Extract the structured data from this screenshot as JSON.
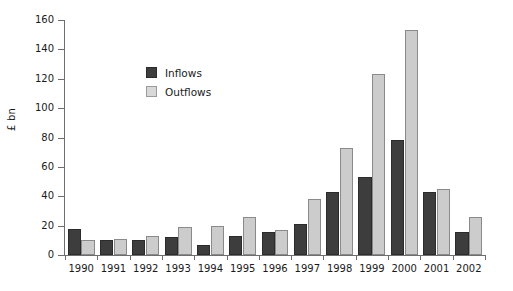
{
  "chart_data": {
    "type": "bar",
    "title": "",
    "subtitle": "",
    "xlabel": "",
    "ylabel": "£ bn",
    "ylim": [
      0,
      160
    ],
    "yticks": [
      0,
      20,
      40,
      60,
      80,
      100,
      120,
      140,
      160
    ],
    "grid": false,
    "legend_position": "upper-left-inside",
    "categories": [
      "1990",
      "1991",
      "1992",
      "1993",
      "1994",
      "1995",
      "1996",
      "1997",
      "1998",
      "1999",
      "2000",
      "2001",
      "2002"
    ],
    "series": [
      {
        "name": "Inflows",
        "color": "#3d3d3d",
        "values": [
          18,
          10,
          10,
          12,
          7,
          13,
          16,
          21,
          43,
          53,
          78,
          43,
          16
        ]
      },
      {
        "name": "Outflows",
        "color": "#cccccc",
        "values": [
          10,
          11,
          13,
          19,
          20,
          26,
          17,
          38,
          73,
          123,
          153,
          45,
          26
        ]
      }
    ]
  },
  "legend": {
    "items": [
      {
        "label": "Inflows",
        "swatch": "dark"
      },
      {
        "label": "Outflows",
        "swatch": "light"
      }
    ]
  },
  "axes": {
    "y_label": "£ bn"
  }
}
